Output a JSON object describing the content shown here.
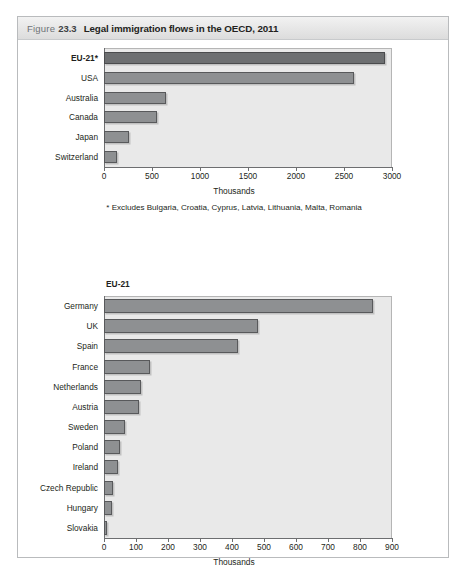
{
  "figure": {
    "label_word": "Figure",
    "number": "23.3",
    "title": "Legal immigration flows in the OECD, 2011"
  },
  "footnote": "* Excludes Bulgaria, Croatia, Cyprus, Latvia, Lithuania, Malta, Romania",
  "colors": {
    "bar_fill": "#8e9092",
    "bar_fill_highlight": "#6d6f71",
    "bar_stroke": "#58595b",
    "plot_background": "#e9e9e9",
    "axis": "#6d6e70",
    "header_background": "#e6e6e6",
    "frame_border": "#b9bbbd",
    "text": "#231f20"
  },
  "chart_data": [
    {
      "type": "bar",
      "orientation": "horizontal",
      "title": "",
      "xlabel": "Thousands",
      "ylabel": "",
      "xlim": [
        0,
        3000
      ],
      "xticks": [
        0,
        500,
        1000,
        1500,
        2000,
        2500,
        3000
      ],
      "xtick_labels": [
        "0",
        "500",
        "1000",
        "1500",
        "2000",
        "2500",
        "3000"
      ],
      "grid": false,
      "legend": "none",
      "categories": [
        "EU-21*",
        "USA",
        "Australia",
        "Canada",
        "Japan",
        "Switzerland"
      ],
      "values": [
        2930,
        2600,
        650,
        550,
        265,
        140
      ],
      "highlight_index": 0,
      "footnote": "* Excludes Bulgaria, Croatia, Cyprus, Latvia, Lithuania, Malta, Romania"
    },
    {
      "type": "bar",
      "orientation": "horizontal",
      "title": "EU-21",
      "xlabel": "Thousands",
      "ylabel": "",
      "xlim": [
        0,
        900
      ],
      "xticks": [
        0,
        100,
        200,
        300,
        400,
        500,
        600,
        700,
        800,
        900
      ],
      "xtick_labels": [
        "0",
        "100",
        "200",
        "300",
        "400",
        "500",
        "600",
        "700",
        "800",
        "900"
      ],
      "grid": false,
      "legend": "none",
      "categories": [
        "Germany",
        "UK",
        "Spain",
        "France",
        "Netherlands",
        "Austria",
        "Sweden",
        "Poland",
        "Ireland",
        "Czech Republic",
        "Hungary",
        "Slovakia"
      ],
      "values": [
        840,
        480,
        420,
        143,
        116,
        108,
        67,
        50,
        43,
        27,
        26,
        10
      ],
      "highlight_index": -1
    }
  ]
}
